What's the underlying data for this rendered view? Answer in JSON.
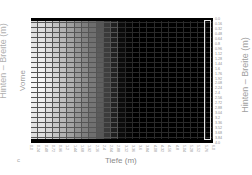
{
  "labels": {
    "panel": "c",
    "xaxis": "Tiefe (m)",
    "left_axis": "Hinten – Breite (m)",
    "left_sub": "Vorne",
    "right_axis": "Hinten – Breite (m)"
  },
  "colors": {
    "background": "#ffffff",
    "plot_background": "#000000",
    "highlight_box": "#e6e6e6",
    "text": "#9a9a9a"
  },
  "chart_data": {
    "type": "heatmap",
    "title": "",
    "panel_label": "c",
    "xlabel": "Tiefe (m)",
    "ylabel_left": "Hinten – Breite (m)",
    "ylabel_left_annotation": "Vorne",
    "ylabel_right": "Hinten – Breite (m)",
    "colormap": "grayscale (white = high, black = low)",
    "x_ticks": [
      "0.0",
      "0.24",
      "0.48",
      "0.72",
      "0.96",
      "1.2",
      "1.44",
      "1.68",
      "1.92",
      "2.16",
      "2.4",
      "2.64",
      "2.88",
      "3.12",
      "3.36",
      "3.6",
      "3.84",
      "4.08",
      "4.32",
      "4.56",
      "4.8",
      "5.04",
      "5.28",
      "5.52",
      "5.76",
      "6.0"
    ],
    "y_ticks": [
      "0.0",
      "0.16",
      "0.32",
      "0.48",
      "0.64",
      "0.8",
      "0.96",
      "1.12",
      "1.28",
      "1.44",
      "1.6",
      "1.76",
      "1.92",
      "2.08",
      "2.24",
      "2.4",
      "2.56",
      "2.72",
      "2.88",
      "3.04",
      "3.2",
      "3.36",
      "3.52",
      "3.68",
      "3.84",
      "4.0"
    ],
    "xlim": [
      0,
      6.0
    ],
    "ylim": [
      0,
      4.0
    ],
    "grid": true,
    "annotations": [
      "white outlined rectangle along the last column (x ≈ 5.76–6.0, full height)"
    ],
    "column_intensity_profile": [
      0.97,
      0.97,
      0.92,
      0.85,
      0.78,
      0.7,
      0.62,
      0.55,
      0.48,
      0.38,
      0.25,
      0.14,
      0.05,
      0.02,
      0,
      0,
      0,
      0,
      0,
      0,
      0,
      0,
      0,
      0,
      0
    ],
    "row_modulation_note": "intensity slightly higher near vertical center (rows ~8–16), lower near top and bottom edges"
  }
}
